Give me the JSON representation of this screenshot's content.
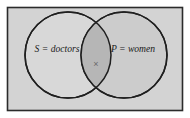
{
  "figure": {
    "kind": "venn-diagram",
    "frame": {
      "fill_color": "#d3d3d3",
      "border_color": "#2b2b2b"
    },
    "sets": [
      {
        "id": "left",
        "label": "S = doctors",
        "fill_color": "#d8d8d8",
        "stroke_color": "#1f1f1f"
      },
      {
        "id": "right",
        "label": "P = women",
        "fill_color": "#cccccc",
        "stroke_color": "#1f1f1f"
      }
    ],
    "intersection": {
      "fill_color": "#b6b6b6",
      "element_marker": "×",
      "marker_name": "cross-mark"
    }
  }
}
